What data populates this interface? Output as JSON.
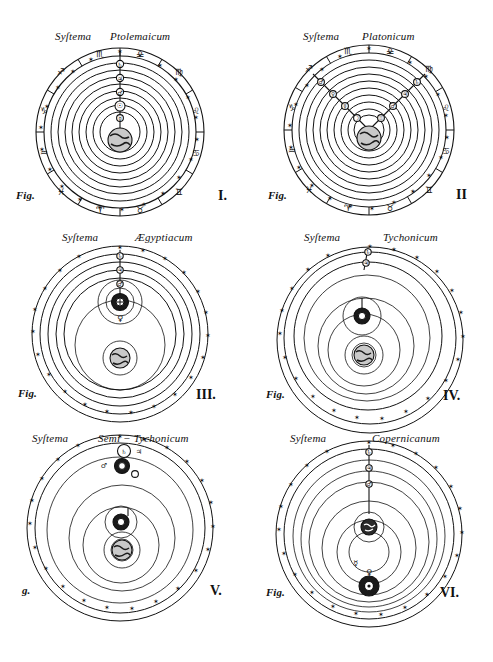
{
  "plate": {
    "kind": "engraved-plate",
    "description": "Six cosmological system diagrams arranged in a 2-column by 3-row grid",
    "background_color": "#ffffff",
    "ink_color": "#111111",
    "width": 493,
    "height": 662
  },
  "figures": [
    {
      "id": "fig-1",
      "title_left": "Syſtema",
      "title_right": "Ptolemaicum",
      "fig_label": "Fig.",
      "numeral": "I.",
      "center_body": "earth",
      "center_body_symbol": "ὰe",
      "orbit_count": 10,
      "has_zodiac_band": true,
      "zodiac_signs": [
        "♈",
        "♉",
        "♊",
        "♋",
        "♌",
        "♍",
        "♎",
        "♏",
        "♐",
        "♑",
        "♒",
        "♓"
      ],
      "spoke_layout": "single-vertical",
      "planets_on_spoke": [
        "☽",
        "☿",
        "♀",
        "☉",
        "♂",
        "♃",
        "♄"
      ],
      "star_count": 24
    },
    {
      "id": "fig-2",
      "title_left": "Syſtema",
      "title_right": "Platonicum",
      "fig_label": "Fig.",
      "numeral": "II",
      "center_body": "earth",
      "center_body_symbol": "ὰe",
      "orbit_count": 11,
      "has_zodiac_band": true,
      "zodiac_signs": [
        "♈",
        "♉",
        "♊",
        "♋",
        "♌",
        "♍",
        "♎",
        "♏",
        "♐",
        "♑",
        "♒",
        "♓"
      ],
      "spoke_layout": "double-diagonal-v",
      "planets_on_spoke": [
        "☽",
        "☉",
        "☿",
        "♀",
        "♂",
        "♃",
        "♄"
      ],
      "star_count": 24
    },
    {
      "id": "fig-3",
      "title_left": "Syſtema",
      "title_right": "Ægyptiacum",
      "fig_label": "Fig.",
      "numeral": "III.",
      "center_body": "earth",
      "center_body_symbol": "ὰe",
      "secondary_body": "sun",
      "secondary_body_symbol": "☉",
      "orbit_count": 7,
      "has_zodiac_band": false,
      "spoke_layout": "single-vertical-upper",
      "planets_on_spoke": [
        "♂",
        "♃",
        "♄"
      ],
      "inner_satellites": [
        "☿",
        "♀"
      ],
      "star_count": 22
    },
    {
      "id": "fig-4",
      "title_left": "Syſtema",
      "title_right": "Tychonicum",
      "fig_label": "Fig.",
      "numeral": "IV.",
      "center_body": "earth",
      "center_body_symbol": "ὰe",
      "secondary_body": "sun",
      "secondary_body_symbol": "☉",
      "orbit_count": 5,
      "has_zodiac_band": false,
      "spoke_layout": "single-vertical-upper",
      "planets_on_spoke": [
        "♃",
        "♄"
      ],
      "inner_satellites": [
        "☿",
        "♀",
        "♂"
      ],
      "star_count": 22
    },
    {
      "id": "fig-5",
      "title_left": "Syſtema",
      "title_right": "Semi − Tychonicum",
      "fig_label": "g.",
      "numeral": "V.",
      "center_body": "earth",
      "center_body_symbol": "ὰe",
      "secondary_body": "sun",
      "secondary_body_symbol": "☉",
      "orbit_count": 4,
      "has_zodiac_band": false,
      "spoke_layout": "top-cluster",
      "planets_on_spoke": [
        "♃",
        "♄"
      ],
      "inner_satellites": [
        "☿",
        "♀",
        "♂"
      ],
      "star_count": 22
    },
    {
      "id": "fig-6",
      "title_left": "Syſtema",
      "title_right": "Copernicanum",
      "fig_label": "Fig.",
      "numeral": "VI.",
      "center_body": "sun",
      "center_body_symbol": "☉",
      "orbit_count": 8,
      "has_zodiac_band": false,
      "spoke_layout": "single-vertical",
      "planets_on_spoke": [
        "♂",
        "♃",
        "♄"
      ],
      "earth_on_orbit": true,
      "earth_symbol": "ὰe",
      "inner_satellites": [
        "☿",
        "♀"
      ],
      "star_count": 22
    }
  ],
  "symbols": {
    "sun": "☉",
    "moon": "☽",
    "mercury": "☿",
    "venus": "♀",
    "earth": "♁",
    "mars": "♂",
    "jupiter": "♃",
    "saturn": "♄",
    "star": "✴"
  }
}
